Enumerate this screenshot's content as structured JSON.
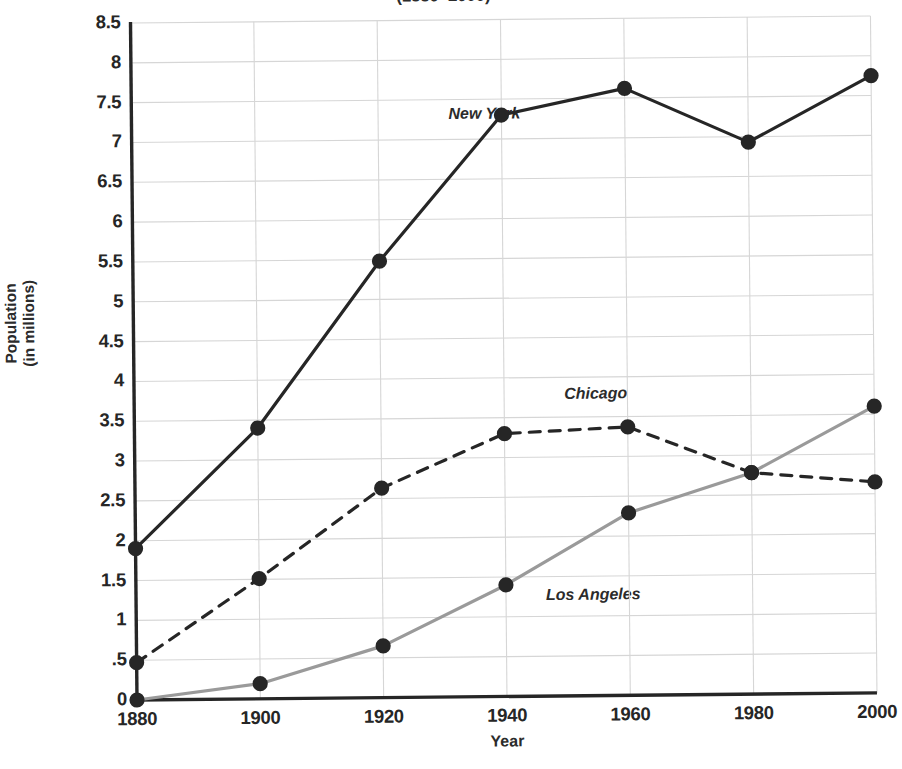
{
  "chart_data": {
    "type": "line",
    "title": "(1880–2000)",
    "xlabel": "Year",
    "ylabel_line1": "Population",
    "ylabel_line2": "(in millions)",
    "x": [
      1880,
      1900,
      1920,
      1940,
      1960,
      1980,
      2000
    ],
    "xtick_labels": [
      "1880",
      "1900",
      "1920",
      "1940",
      "1960",
      "1980",
      "2000"
    ],
    "ytick_labels": [
      "8.5",
      "8",
      "7.5",
      "7",
      "6.5",
      "6",
      "5.5",
      "5",
      "4.5",
      "4",
      "3.5",
      "3",
      "2.5",
      "2",
      "1.5",
      "1",
      ".5",
      "0"
    ],
    "ytick_values": [
      8.5,
      8,
      7.5,
      7,
      6.5,
      6,
      5.5,
      5,
      4.5,
      4,
      3.5,
      3,
      2.5,
      2,
      1.5,
      1,
      0.5,
      0
    ],
    "ylim": [
      0,
      8.5
    ],
    "xlim": [
      1880,
      2000
    ],
    "grid": true,
    "legend_position": "inline-labels",
    "series": [
      {
        "name": "New York",
        "label": "New York",
        "style": "solid",
        "color": "#262626",
        "values": [
          1.9,
          3.4,
          5.48,
          7.3,
          7.62,
          6.93,
          7.75
        ]
      },
      {
        "name": "Chicago",
        "label": "Chicago",
        "style": "dashed",
        "color": "#262626",
        "values": [
          0.47,
          1.51,
          2.63,
          3.3,
          3.37,
          2.78,
          2.65
        ]
      },
      {
        "name": "Los Angeles",
        "label": "Los Angeles",
        "style": "solid",
        "color": "#9a9a9a",
        "values": [
          0.0,
          0.19,
          0.65,
          1.4,
          2.29,
          2.78,
          3.6
        ]
      }
    ]
  },
  "axes": {
    "axis_color": "#262626",
    "grid_color": "#d6d6d6",
    "marker_color": "#262626"
  }
}
